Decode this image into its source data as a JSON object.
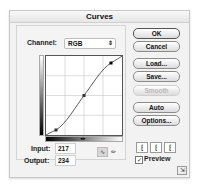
{
  "window": {
    "title": "Curves"
  },
  "channel": {
    "label": "Channel:",
    "value": "RGB"
  },
  "curve": {
    "points": [
      [
        0,
        0
      ],
      [
        30,
        13
      ],
      [
        128,
        128
      ],
      [
        217,
        234
      ],
      [
        255,
        255
      ]
    ],
    "grid_divisions": 4,
    "h_slider_marker": "◂▸"
  },
  "input": {
    "label": "Input:",
    "value": "217"
  },
  "output": {
    "label": "Output:",
    "value": "234"
  },
  "tools": {
    "curve_tool": "curve-point-tool",
    "pencil_tool": "pencil-tool"
  },
  "buttons": {
    "ok": "OK",
    "cancel": "Cancel",
    "load": "Load...",
    "save": "Save...",
    "smooth": "Smooth",
    "auto": "Auto",
    "options": "Options..."
  },
  "eyedroppers": [
    "black-point-eyedropper",
    "gray-point-eyedropper",
    "white-point-eyedropper"
  ],
  "preview": {
    "label": "Preview",
    "checked": true
  }
}
